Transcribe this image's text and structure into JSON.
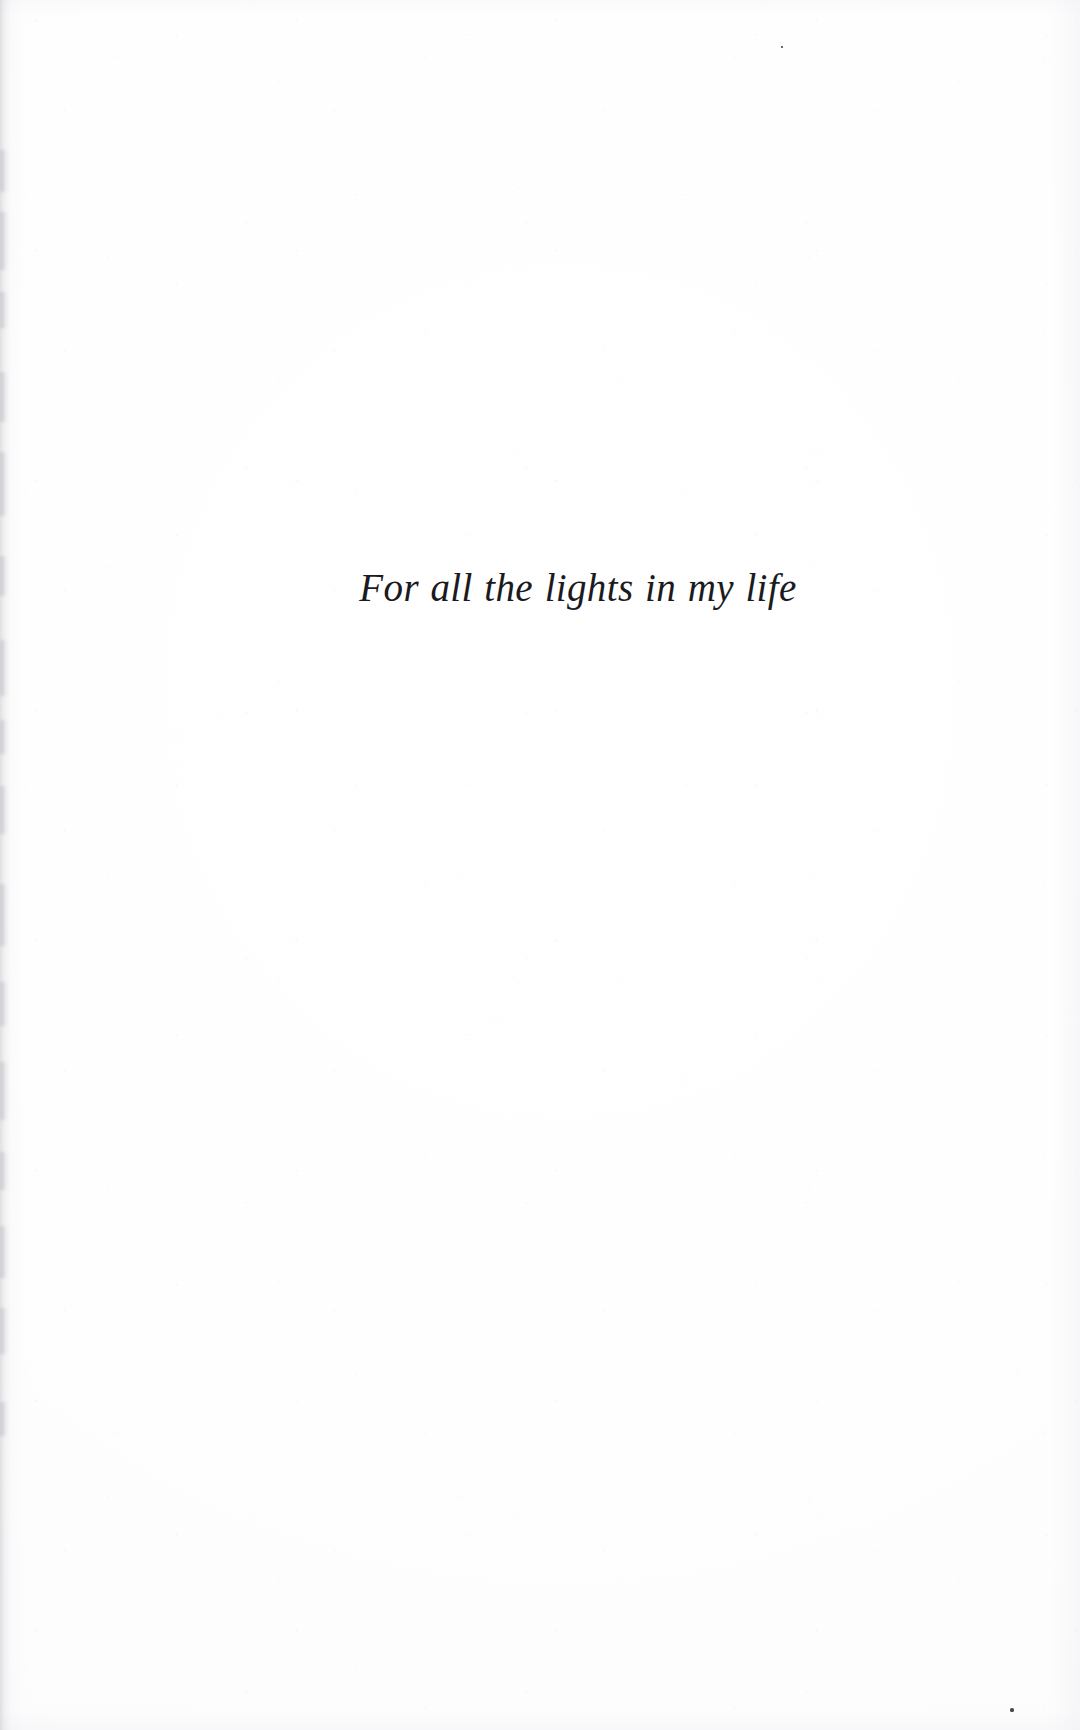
{
  "document": {
    "type": "book-dedication-page",
    "page_background_color": "#ffffff",
    "text_color": "#1b1b1e",
    "dedication": {
      "text": "For all the lights in my life",
      "style": "italic serif",
      "alignment": "center"
    }
  },
  "artifacts": {
    "gutter_shadow_color": "#a8a8b0",
    "speck_color": "#4a4a50",
    "gutter_streaks": [
      {
        "top": 150,
        "height": 42
      },
      {
        "top": 212,
        "height": 58
      },
      {
        "top": 292,
        "height": 36
      },
      {
        "top": 372,
        "height": 50
      },
      {
        "top": 452,
        "height": 64
      },
      {
        "top": 556,
        "height": 40
      },
      {
        "top": 640,
        "height": 56
      },
      {
        "top": 720,
        "height": 34
      },
      {
        "top": 786,
        "height": 48
      },
      {
        "top": 884,
        "height": 62
      },
      {
        "top": 982,
        "height": 44
      },
      {
        "top": 1062,
        "height": 58
      },
      {
        "top": 1152,
        "height": 38
      },
      {
        "top": 1226,
        "height": 52
      },
      {
        "top": 1308,
        "height": 46
      },
      {
        "top": 1402,
        "height": 34
      }
    ],
    "specks": [
      {
        "left": 1010,
        "top": 1708,
        "size": 4
      },
      {
        "left": 781,
        "top": 46,
        "size": 2
      }
    ]
  }
}
